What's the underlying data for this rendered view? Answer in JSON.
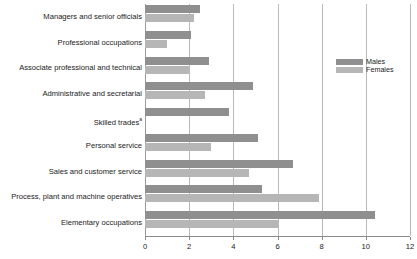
{
  "chart_data": {
    "type": "bar",
    "orientation": "horizontal",
    "title": "",
    "xlabel": "",
    "ylabel": "",
    "xlim": [
      0,
      12
    ],
    "xticks": [
      0,
      2,
      4,
      6,
      8,
      10,
      12
    ],
    "xtick_labels": [
      "0",
      "2",
      "4",
      "6",
      "8",
      "10",
      "12"
    ],
    "grid": true,
    "grid_axis": "x",
    "legend_position": "right",
    "categories": [
      "Managers and senior officials",
      "Professional occupations",
      "Associate professional and technical",
      "Administrative and secretarial",
      "Skilled trades",
      "Personal service",
      "Sales and customer service",
      "Process, plant and machine operatives",
      "Elementary occupations"
    ],
    "category_footnotes": [
      "",
      "",
      "",
      "",
      "a",
      "",
      "",
      "",
      ""
    ],
    "series": [
      {
        "name": "Males",
        "color": "#8f8f8f",
        "values": [
          2.5,
          2.1,
          2.9,
          4.9,
          3.8,
          5.1,
          6.7,
          5.3,
          10.4
        ]
      },
      {
        "name": "Females",
        "color": "#b6b6b6",
        "values": [
          2.2,
          1.0,
          2.0,
          2.7,
          0.0,
          3.0,
          4.7,
          7.9,
          6.0
        ]
      }
    ]
  },
  "legend": {
    "items": [
      {
        "label": "Males",
        "key": "males"
      },
      {
        "label": "Females",
        "key": "females"
      }
    ]
  },
  "colors": {
    "males": "#8f8f8f",
    "females": "#b6b6b6",
    "gridline": "#b9b9b9",
    "axis": "#8a8a8a",
    "text": "#1a1a1a",
    "background": "#ffffff"
  }
}
